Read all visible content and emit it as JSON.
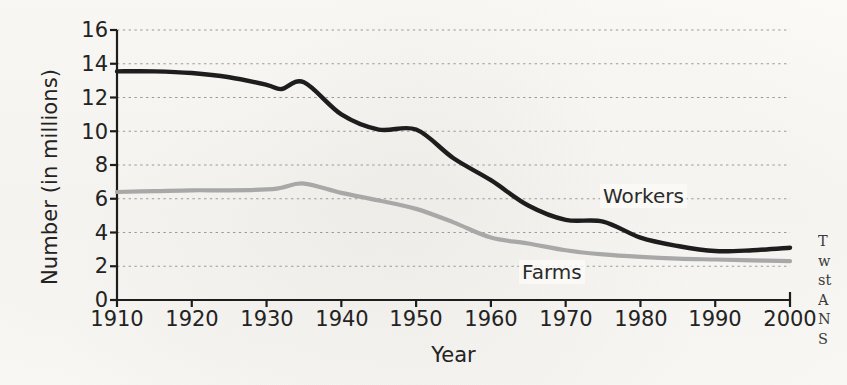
{
  "figure": {
    "background_color": "#fbfaf7",
    "x_axis_title": "Year",
    "y_axis_title": "Number (in millions)"
  },
  "chart_data": {
    "type": "line",
    "title": "",
    "xlabel": "Year",
    "ylabel": "Number (in millions)",
    "xlim": [
      1910,
      2000
    ],
    "ylim": [
      0,
      16
    ],
    "grid": true,
    "grid_style": "dotted-horizontal",
    "legend_position": "inline-annotation",
    "x_ticks": [
      1910,
      1920,
      1930,
      1940,
      1950,
      1960,
      1970,
      1980,
      1990,
      2000
    ],
    "y_ticks": [
      0,
      2,
      4,
      6,
      8,
      10,
      12,
      14,
      16
    ],
    "x": [
      1910,
      1915,
      1920,
      1925,
      1930,
      1932,
      1935,
      1940,
      1945,
      1950,
      1955,
      1960,
      1965,
      1970,
      1975,
      1980,
      1985,
      1990,
      1995,
      2000
    ],
    "series": [
      {
        "name": "Workers",
        "color": "#1d1d1d",
        "label": "Workers",
        "values": [
          13.55,
          13.55,
          13.45,
          13.2,
          12.75,
          12.5,
          12.9,
          11.0,
          10.1,
          10.1,
          8.4,
          7.1,
          5.6,
          4.75,
          4.65,
          3.7,
          3.2,
          2.9,
          2.95,
          3.1
        ]
      },
      {
        "name": "Farms",
        "color": "#a8a8a8",
        "label": "Farms",
        "values": [
          6.4,
          6.45,
          6.5,
          6.5,
          6.55,
          6.65,
          6.9,
          6.35,
          5.9,
          5.4,
          4.6,
          3.7,
          3.35,
          2.95,
          2.7,
          2.55,
          2.45,
          2.4,
          2.35,
          2.3
        ]
      }
    ]
  },
  "side_text_fragments": [
    "T",
    "w",
    "st",
    "A",
    "N",
    "S"
  ]
}
